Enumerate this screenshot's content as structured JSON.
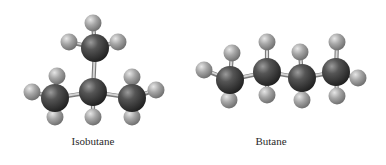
{
  "figure": {
    "colors": {
      "background": "#ffffff",
      "carbon": "#3c3c3c",
      "hydrogen": "#a8a8a8",
      "bond": "#b8b8b8",
      "label": "#2a2a2a"
    }
  },
  "molecules": [
    {
      "name": "Isobutane",
      "label_pos": {
        "x": 93,
        "y": 143
      },
      "carbons": [
        {
          "id": "c_top",
          "x": 95,
          "y": 48
        },
        {
          "id": "c_center",
          "x": 93,
          "y": 92
        },
        {
          "id": "c_left",
          "x": 55,
          "y": 98
        },
        {
          "id": "c_right",
          "x": 132,
          "y": 98
        }
      ],
      "hydrogens": [
        {
          "bond_to": "c_top",
          "x": 93,
          "y": 23
        },
        {
          "bond_to": "c_top",
          "x": 69,
          "y": 42
        },
        {
          "bond_to": "c_top",
          "x": 118,
          "y": 42
        },
        {
          "bond_to": "c_left",
          "x": 32,
          "y": 92
        },
        {
          "bond_to": "c_left",
          "x": 57,
          "y": 76
        },
        {
          "bond_to": "c_left",
          "x": 55,
          "y": 117
        },
        {
          "bond_to": "c_center",
          "x": 93,
          "y": 117
        },
        {
          "bond_to": "c_right",
          "x": 132,
          "y": 77
        },
        {
          "bond_to": "c_right",
          "x": 156,
          "y": 90
        },
        {
          "bond_to": "c_right",
          "x": 132,
          "y": 117
        }
      ],
      "cc_bonds": [
        [
          "c_center",
          "c_top"
        ],
        [
          "c_center",
          "c_left"
        ],
        [
          "c_center",
          "c_right"
        ]
      ]
    },
    {
      "name": "Butane",
      "label_pos": {
        "x": 271,
        "y": 143
      },
      "carbons": [
        {
          "id": "c1",
          "x": 230,
          "y": 80
        },
        {
          "id": "c2",
          "x": 267,
          "y": 72
        },
        {
          "id": "c3",
          "x": 302,
          "y": 78
        },
        {
          "id": "c4",
          "x": 336,
          "y": 72
        }
      ],
      "hydrogens": [
        {
          "bond_to": "c1",
          "x": 204,
          "y": 70
        },
        {
          "bond_to": "c1",
          "x": 232,
          "y": 53
        },
        {
          "bond_to": "c1",
          "x": 229,
          "y": 100
        },
        {
          "bond_to": "c2",
          "x": 267,
          "y": 42
        },
        {
          "bond_to": "c2",
          "x": 267,
          "y": 95
        },
        {
          "bond_to": "c3",
          "x": 300,
          "y": 52
        },
        {
          "bond_to": "c3",
          "x": 302,
          "y": 100
        },
        {
          "bond_to": "c4",
          "x": 337,
          "y": 42
        },
        {
          "bond_to": "c4",
          "x": 337,
          "y": 96
        },
        {
          "bond_to": "c4",
          "x": 358,
          "y": 78
        }
      ],
      "cc_bonds": [
        [
          "c1",
          "c2"
        ],
        [
          "c2",
          "c3"
        ],
        [
          "c3",
          "c4"
        ]
      ]
    }
  ]
}
